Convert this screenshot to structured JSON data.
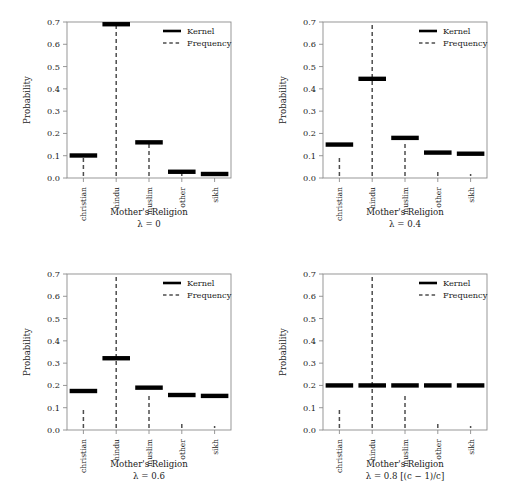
{
  "figure": {
    "layout": "2x2 grid of panels",
    "n_panels": 4
  },
  "axis": {
    "ylabel": "Probability",
    "xlabel": "Mother's Religion",
    "yticks": [
      "0.0",
      "0.1",
      "0.2",
      "0.3",
      "0.4",
      "0.5",
      "0.6",
      "0.7"
    ],
    "ytick_values": [
      0.0,
      0.1,
      0.2,
      0.3,
      0.4,
      0.5,
      0.6,
      0.7
    ],
    "ylim": [
      0.0,
      0.7
    ],
    "categories": [
      "christian",
      "hindu",
      "muslim",
      "other",
      "sikh"
    ]
  },
  "legend": {
    "position": "top-right inside plot frame",
    "entries": [
      {
        "label": "Kernel",
        "style": "solid"
      },
      {
        "label": "Frequency",
        "style": "dashed"
      }
    ]
  },
  "colors": {
    "kernel": "#000000",
    "frequency": "#4d4d4d",
    "frame": "#8c8c8c",
    "background": "#ffffff",
    "text": "#1a1a1a"
  },
  "chart_data": [
    {
      "type": "bar",
      "title": "",
      "subtitle": "λ = 0",
      "xlabel": "Mother's Religion",
      "ylabel": "Probability",
      "ylim": [
        0.0,
        0.7
      ],
      "grid": false,
      "legend_position": "top-right",
      "categories": [
        "christian",
        "hindu",
        "muslim",
        "other",
        "sikh"
      ],
      "series": [
        {
          "name": "Kernel",
          "values": [
            0.101,
            0.69,
            0.16,
            0.028,
            0.018
          ]
        },
        {
          "name": "Frequency",
          "values": [
            0.101,
            0.69,
            0.16,
            0.028,
            0.018
          ]
        }
      ]
    },
    {
      "type": "bar",
      "title": "",
      "subtitle": "λ = 0.4",
      "xlabel": "Mother's Religion",
      "ylabel": "Probability",
      "ylim": [
        0.0,
        0.7
      ],
      "grid": false,
      "legend_position": "top-right",
      "categories": [
        "christian",
        "hindu",
        "muslim",
        "other",
        "sikh"
      ],
      "series": [
        {
          "name": "Kernel",
          "values": [
            0.15,
            0.445,
            0.18,
            0.114,
            0.109
          ]
        },
        {
          "name": "Frequency",
          "values": [
            0.101,
            0.69,
            0.16,
            0.028,
            0.018
          ]
        }
      ]
    },
    {
      "type": "bar",
      "title": "",
      "subtitle": "λ = 0.6",
      "xlabel": "Mother's Religion",
      "ylabel": "Probability",
      "ylim": [
        0.0,
        0.7
      ],
      "grid": false,
      "legend_position": "top-right",
      "categories": [
        "christian",
        "hindu",
        "muslim",
        "other",
        "sikh"
      ],
      "series": [
        {
          "name": "Kernel",
          "values": [
            0.175,
            0.322,
            0.19,
            0.157,
            0.153
          ]
        },
        {
          "name": "Frequency",
          "values": [
            0.101,
            0.69,
            0.16,
            0.028,
            0.018
          ]
        }
      ]
    },
    {
      "type": "bar",
      "title": "",
      "subtitle": "λ = 0.8 [(c − 1)/c]",
      "xlabel": "Mother's Religion",
      "ylabel": "Probability",
      "ylim": [
        0.0,
        0.7
      ],
      "grid": false,
      "legend_position": "top-right",
      "categories": [
        "christian",
        "hindu",
        "muslim",
        "other",
        "sikh"
      ],
      "series": [
        {
          "name": "Kernel",
          "values": [
            0.2,
            0.2,
            0.2,
            0.2,
            0.2
          ]
        },
        {
          "name": "Frequency",
          "values": [
            0.101,
            0.69,
            0.16,
            0.028,
            0.018
          ]
        }
      ]
    }
  ]
}
